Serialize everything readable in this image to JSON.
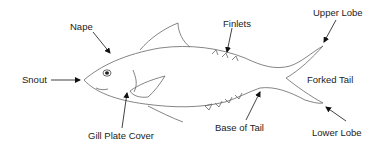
{
  "diagram": {
    "labels": {
      "snout": "Snout",
      "nape": "Nape",
      "gill_plate_cover": "Gill Plate Cover",
      "finlets": "Finlets",
      "base_of_tail": "Base of Tail",
      "upper_lobe": "Upper Lobe",
      "forked_tail": "Forked Tail",
      "lower_lobe": "Lower Lobe"
    },
    "colors": {
      "outline": "#555555",
      "arrow": "#111111",
      "text": "#222222",
      "background": "#ffffff"
    }
  }
}
